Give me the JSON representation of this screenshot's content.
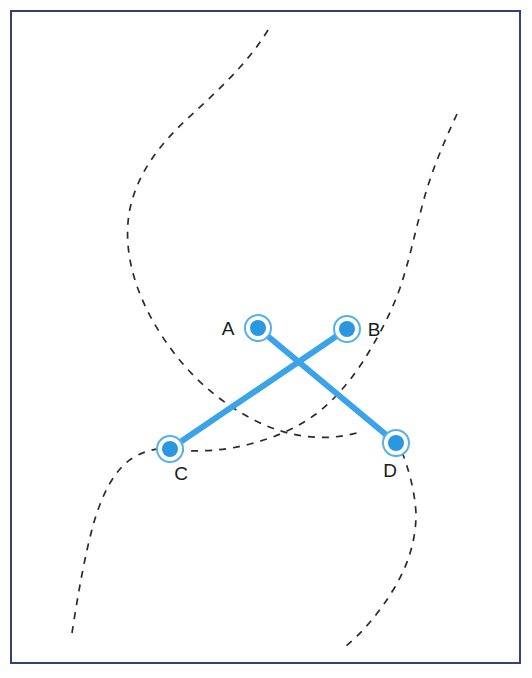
{
  "figure": {
    "width": 532,
    "height": 678,
    "background_color": "#ffffff"
  },
  "frame": {
    "name": "outer-border",
    "stroke_color": "#33407a",
    "stroke_width": 2,
    "x": 11,
    "y": 11,
    "width": 509,
    "height": 652
  },
  "colors": {
    "node_fill": "#2a98e0",
    "node_ring": "#56b0ec",
    "node_inner_gap": "#ffffff",
    "connector": "#3ba3e8",
    "curve": "#2b2b2b",
    "label_text": "#1a1a1a",
    "border": "#33407a"
  },
  "nodes": [
    {
      "id": "A",
      "label": "A",
      "cx": 258,
      "cy": 328,
      "radius_inner": 8,
      "radius_outer": 14,
      "label_x": 228,
      "label_y": 335,
      "label_anchor": "middle"
    },
    {
      "id": "B",
      "label": "B",
      "cx": 347,
      "cy": 329,
      "radius_inner": 8,
      "radius_outer": 14,
      "label_x": 374,
      "label_y": 336,
      "label_anchor": "middle"
    },
    {
      "id": "C",
      "label": "C",
      "cx": 170,
      "cy": 449,
      "radius_inner": 8,
      "radius_outer": 14,
      "label_x": 181,
      "label_y": 480,
      "label_anchor": "middle"
    },
    {
      "id": "D",
      "label": "D",
      "cx": 396,
      "cy": 443,
      "radius_inner": 8,
      "radius_outer": 14,
      "label_x": 390,
      "label_y": 477,
      "label_anchor": "middle"
    }
  ],
  "connectors": [
    {
      "id": "A-D",
      "from": "A",
      "to": "D",
      "x1": 258,
      "y1": 328,
      "x2": 396,
      "y2": 443,
      "stroke_width": 6
    },
    {
      "id": "B-C",
      "from": "B",
      "to": "C",
      "x1": 347,
      "y1": 329,
      "x2": 170,
      "y2": 449,
      "stroke_width": 6
    }
  ],
  "crossing_point": {
    "x": 300,
    "y": 370
  },
  "curves": [
    {
      "id": "curve-upper-left",
      "path": "M 268 30 C 246 66, 215 93, 186 120 C 156 148, 135 178, 129 214 C 123 254, 136 296, 162 336 C 186 373, 218 402, 256 421 C 292 439, 330 442, 363 431",
      "stroke_width": 1.7,
      "dash": "7 7"
    },
    {
      "id": "curve-upper-right",
      "path": "M 457 114 C 444 142, 432 170, 424 199 C 415 232, 409 262, 400 288 C 390 316, 376 341, 362 363 C 348 384, 333 401, 316 414 C 297 428, 274 438, 250 444 C 224 451, 197 452, 176 450",
      "stroke_width": 1.7,
      "dash": "7 7"
    },
    {
      "id": "curve-lower-left",
      "path": "M 72 633 C 78 594, 85 554, 94 522 C 103 492, 115 470, 131 459 C 145 450, 160 447, 176 449",
      "stroke_width": 1.7,
      "dash": "7 7"
    },
    {
      "id": "curve-lower-right",
      "path": "M 402 452 C 409 470, 415 492, 416 514 C 416 539, 409 563, 395 587 C 380 612, 363 632, 346 646",
      "stroke_width": 1.7,
      "dash": "7 7"
    }
  ],
  "chart_data": {
    "type": "scatter",
    "title": "",
    "xlabel": "",
    "ylabel": "",
    "points": [
      {
        "label": "A",
        "x": 258,
        "y": 328
      },
      {
        "label": "B",
        "x": 347,
        "y": 329
      },
      {
        "label": "C",
        "x": 170,
        "y": 449
      },
      {
        "label": "D",
        "x": 396,
        "y": 443
      }
    ],
    "edges": [
      {
        "from": "A",
        "to": "D"
      },
      {
        "from": "B",
        "to": "C"
      }
    ],
    "grid": false,
    "legend": "none"
  }
}
